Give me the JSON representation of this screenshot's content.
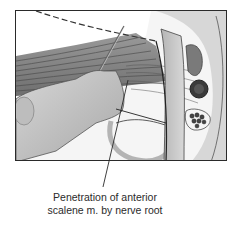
{
  "figure": {
    "caption": {
      "line1": "Penetration of anterior",
      "line2": "scalene m. by nerve root"
    },
    "colors": {
      "frame_border": "#2a2a2a",
      "caption_text": "#2b2b2b",
      "background": "#ffffff"
    }
  }
}
